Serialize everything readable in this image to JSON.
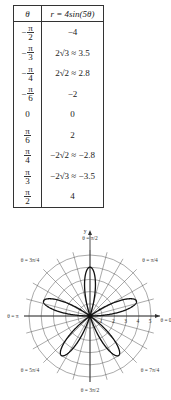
{
  "table": {
    "headers": [
      "θ",
      "r = 4sin(5θ)"
    ],
    "rows": [
      {
        "theta_sign": "−",
        "theta_num": "π",
        "theta_den": "2",
        "r": "−4"
      },
      {
        "theta_sign": "−",
        "theta_num": "π",
        "theta_den": "3",
        "r": "2√3 ≈ 3.5"
      },
      {
        "theta_sign": "−",
        "theta_num": "π",
        "theta_den": "4",
        "r": "2√2 ≈ 2.8"
      },
      {
        "theta_sign": "−",
        "theta_num": "π",
        "theta_den": "6",
        "r": "−2"
      },
      {
        "theta_plain": "0",
        "r": "0"
      },
      {
        "theta_sign": "",
        "theta_num": "π",
        "theta_den": "6",
        "r": "2"
      },
      {
        "theta_sign": "",
        "theta_num": "π",
        "theta_den": "4",
        "r": "−2√2 ≈ −2.8"
      },
      {
        "theta_sign": "",
        "theta_num": "π",
        "theta_den": "3",
        "r": "−2√3 ≈ −3.5"
      },
      {
        "theta_sign": "",
        "theta_num": "π",
        "theta_den": "2",
        "r": "4"
      }
    ]
  },
  "chart_data": [
    {
      "type": "table",
      "title": "",
      "columns": [
        "θ",
        "r = 4sin(5θ)"
      ],
      "rows": [
        [
          "-π/2",
          "-4"
        ],
        [
          "-π/3",
          "2√3 ≈ 3.5"
        ],
        [
          "-π/4",
          "2√2 ≈ 2.8"
        ],
        [
          "-π/6",
          "-2"
        ],
        [
          "0",
          "0"
        ],
        [
          "π/6",
          "2"
        ],
        [
          "π/4",
          "-2√2 ≈ -2.8"
        ],
        [
          "π/3",
          "-2√3 ≈ -3.5"
        ],
        [
          "π/2",
          "4"
        ]
      ]
    },
    {
      "type": "line",
      "subtype": "polar",
      "title": "",
      "equation": "r = 4sin(5θ)",
      "series": [
        {
          "name": "r = 4sin(5θ)",
          "petals": 5,
          "amplitude": 4
        }
      ],
      "radial_ticks": [
        "1",
        "2",
        "3",
        "4",
        "5"
      ],
      "rlim": [
        0,
        5
      ],
      "angular_grid_step": "π/12",
      "grid": true,
      "axis_labels": {
        "x": "x",
        "y": "y"
      },
      "angle_labels": [
        "θ = π/2",
        "θ = π/4",
        "θ = 0",
        "θ = 7π/4",
        "θ = 3π/2",
        "θ = 5π/4",
        "θ = π",
        "θ = 3π/4"
      ]
    }
  ],
  "plot": {
    "y_axis_label": "y",
    "x_axis_label": "x",
    "radial_ticks": [
      "1",
      "2",
      "3",
      "4",
      "5"
    ],
    "angle_labels": {
      "top": "θ = π/2",
      "top_right": "θ = π/4",
      "right": "θ = 0",
      "bottom_right": "θ = 7π/4",
      "bottom": "θ = 3π/2",
      "bottom_left": "θ = 5π/4",
      "left": "θ = π",
      "top_left": "θ = 3π/4"
    }
  }
}
